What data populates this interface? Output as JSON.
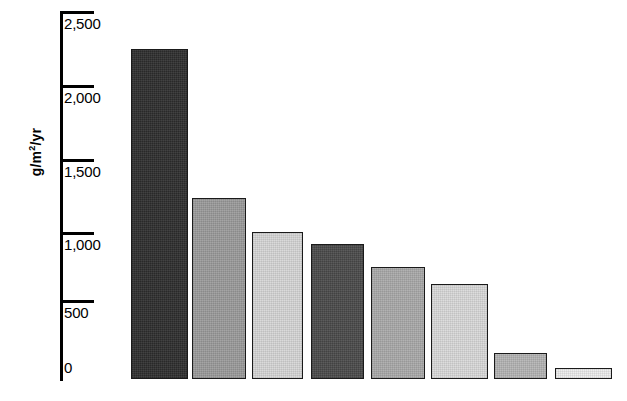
{
  "chart_data": {
    "type": "bar",
    "title": "",
    "subtitle": "",
    "xlabel": "",
    "ylabel": "g/m2/yr",
    "ylabel_parts": {
      "prefix": "g/m",
      "exponent": "2",
      "suffix": "/yr"
    },
    "ylim": [
      0,
      2500
    ],
    "yticks": [
      0,
      500,
      1000,
      1500,
      2000,
      2500
    ],
    "ytick_labels": [
      "0",
      "500",
      "1,000",
      "1,500",
      "2,000",
      "2,500"
    ],
    "grid": false,
    "legend": "none",
    "categories": [
      "",
      "",
      "",
      "",
      "",
      "",
      "",
      ""
    ],
    "values": [
      2250,
      1230,
      1000,
      920,
      760,
      650,
      180,
      75
    ],
    "bar_colors": [
      "#2d2d2d",
      "#9b9b9b",
      "#d6d6d6",
      "#4a4a4a",
      "#aaaaaa",
      "#d9d9d9",
      "#b4b4b4",
      "#ececec"
    ],
    "bar_edge_color": "#1a1a1a",
    "axis_color": "#000000",
    "background_color": "#ffffff"
  },
  "axis": {
    "ticks": [
      {
        "label": "2,500",
        "value": 2500
      },
      {
        "label": "2,000",
        "value": 2000
      },
      {
        "label": "1,500",
        "value": 1500
      },
      {
        "label": "1,000",
        "value": 1000
      },
      {
        "label": "500",
        "value": 500
      },
      {
        "label": "0",
        "value": 0
      }
    ]
  }
}
